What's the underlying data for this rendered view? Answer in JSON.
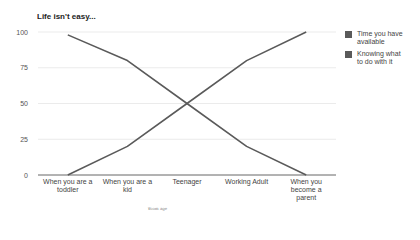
{
  "chart_data": {
    "type": "line",
    "title": "Life isn't easy...",
    "xlabel": "",
    "ylabel": "",
    "ylim": [
      0,
      100
    ],
    "yticks": [
      0,
      25,
      50,
      75,
      100
    ],
    "grid": true,
    "legend_position": "right",
    "categories": [
      "When you are a toddler",
      "When you are a kid",
      "Teenager",
      "Working Adult",
      "When you become a parent"
    ],
    "category_lines": [
      [
        "When you are a",
        "toddler"
      ],
      [
        "When you are a",
        "kid"
      ],
      [
        "Teenager"
      ],
      [
        "Working Adult"
      ],
      [
        "When you",
        "become a",
        "parent"
      ]
    ],
    "series": [
      {
        "name": "Time you have available",
        "legend_lines": [
          "Time you have",
          "available"
        ],
        "color": "#5a5a5a",
        "values": [
          98,
          80,
          50,
          20,
          0
        ]
      },
      {
        "name": "Knowing what to do with it",
        "legend_lines": [
          "Knowing what",
          "to do with it"
        ],
        "color": "#5a5a5a",
        "values": [
          0,
          20,
          50,
          80,
          100
        ]
      }
    ]
  },
  "watermark": "Ꝟoom age"
}
